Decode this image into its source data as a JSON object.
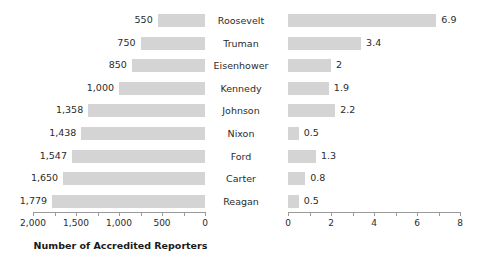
{
  "chart_data": [
    {
      "type": "bar",
      "orientation": "horizontal",
      "id": "accredited-reporters",
      "title": "",
      "xlabel": "Number of Accredited Reporters",
      "ylabel": "",
      "categories": [
        "Roosevelt",
        "Truman",
        "Eisenhower",
        "Kennedy",
        "Johnson",
        "Nixon",
        "Ford",
        "Carter",
        "Reagan"
      ],
      "values": [
        550,
        750,
        850,
        1000,
        1358,
        1438,
        1547,
        1650,
        1779
      ],
      "value_labels": [
        "550",
        "750",
        "850",
        "1,000",
        "1,358",
        "1,438",
        "1,547",
        "1,650",
        "1,779"
      ],
      "xlim": [
        2000,
        0
      ],
      "axis_reversed": true,
      "tick_labels": [
        "2,000",
        "1,500",
        "1,000",
        "500",
        "0"
      ],
      "tick_values": [
        2000,
        1500,
        1000,
        500,
        0
      ],
      "minor_tick_step": 250,
      "grid": false,
      "legend": "none",
      "bar_color": "#d4d4d4"
    },
    {
      "type": "bar",
      "orientation": "horizontal",
      "id": "press-conferences",
      "title": "",
      "xlabel": "Average Number of Press Conferences\nper Month",
      "ylabel": "",
      "categories": [
        "Roosevelt",
        "Truman",
        "Eisenhower",
        "Kennedy",
        "Johnson",
        "Nixon",
        "Ford",
        "Carter",
        "Reagan"
      ],
      "values": [
        6.9,
        3.4,
        2,
        1.9,
        2.2,
        0.5,
        1.3,
        0.8,
        0.5
      ],
      "value_labels": [
        "6.9",
        "3.4",
        "2",
        "1.9",
        "2.2",
        "0.5",
        "1.3",
        "0.8",
        "0.5"
      ],
      "xlim": [
        0,
        8
      ],
      "axis_reversed": false,
      "tick_labels": [
        "0",
        "2",
        "4",
        "6",
        "8"
      ],
      "tick_values": [
        0,
        2,
        4,
        6,
        8
      ],
      "minor_tick_step": 1,
      "grid": false,
      "legend": "none",
      "bar_color": "#d4d4d4"
    }
  ]
}
